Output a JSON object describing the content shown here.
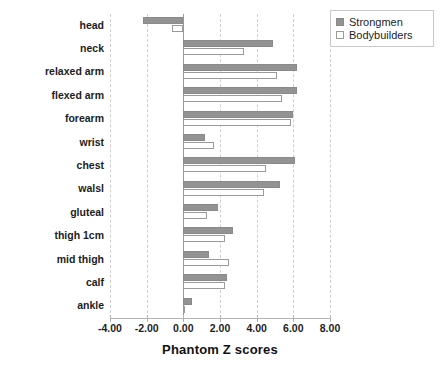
{
  "chart_data": {
    "type": "bar",
    "orientation": "horizontal",
    "title": "",
    "xlabel": "Phantom Z scores",
    "ylabel": "",
    "xlim": [
      -4.0,
      8.0
    ],
    "xticks": [
      -4.0,
      -2.0,
      0.0,
      2.0,
      4.0,
      6.0,
      8.0
    ],
    "xtick_labels": [
      "-4.00",
      "-2.00",
      "0.00",
      "2.00",
      "4.00",
      "6.00",
      "8.00"
    ],
    "grid": true,
    "grid_axis": "x",
    "legend_position": "top-right",
    "categories": [
      "head",
      "neck",
      "relaxed arm",
      "flexed arm",
      "forearm",
      "wrist",
      "chest",
      "walsl",
      "gluteal",
      "thigh 1cm",
      "mid thigh",
      "calf",
      "ankle"
    ],
    "series": [
      {
        "name": "Strongmen",
        "color": "#939393",
        "values": [
          -2.2,
          4.9,
          6.2,
          6.2,
          6.0,
          1.2,
          6.1,
          5.3,
          1.9,
          2.7,
          1.4,
          2.4,
          0.5
        ]
      },
      {
        "name": "Bodybuilders",
        "color": "#ffffff",
        "values": [
          -0.6,
          3.3,
          5.1,
          5.4,
          5.9,
          1.7,
          4.5,
          4.4,
          1.3,
          2.3,
          2.5,
          2.3,
          0.1
        ]
      }
    ]
  },
  "legend": {
    "items": [
      {
        "label": "Strongmen"
      },
      {
        "label": "Bodybuilders"
      }
    ]
  },
  "axis": {
    "x_title": "Phantom Z scores"
  }
}
